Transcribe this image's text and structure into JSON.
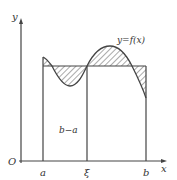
{
  "labels": {
    "y_axis": "y",
    "x_axis": "x",
    "origin": "O",
    "a": "a",
    "xi": "ξ",
    "b": "b",
    "width": "b−a",
    "function": "y=f(x)"
  },
  "colors": {
    "stroke": "#444444",
    "background": "#ffffff"
  }
}
